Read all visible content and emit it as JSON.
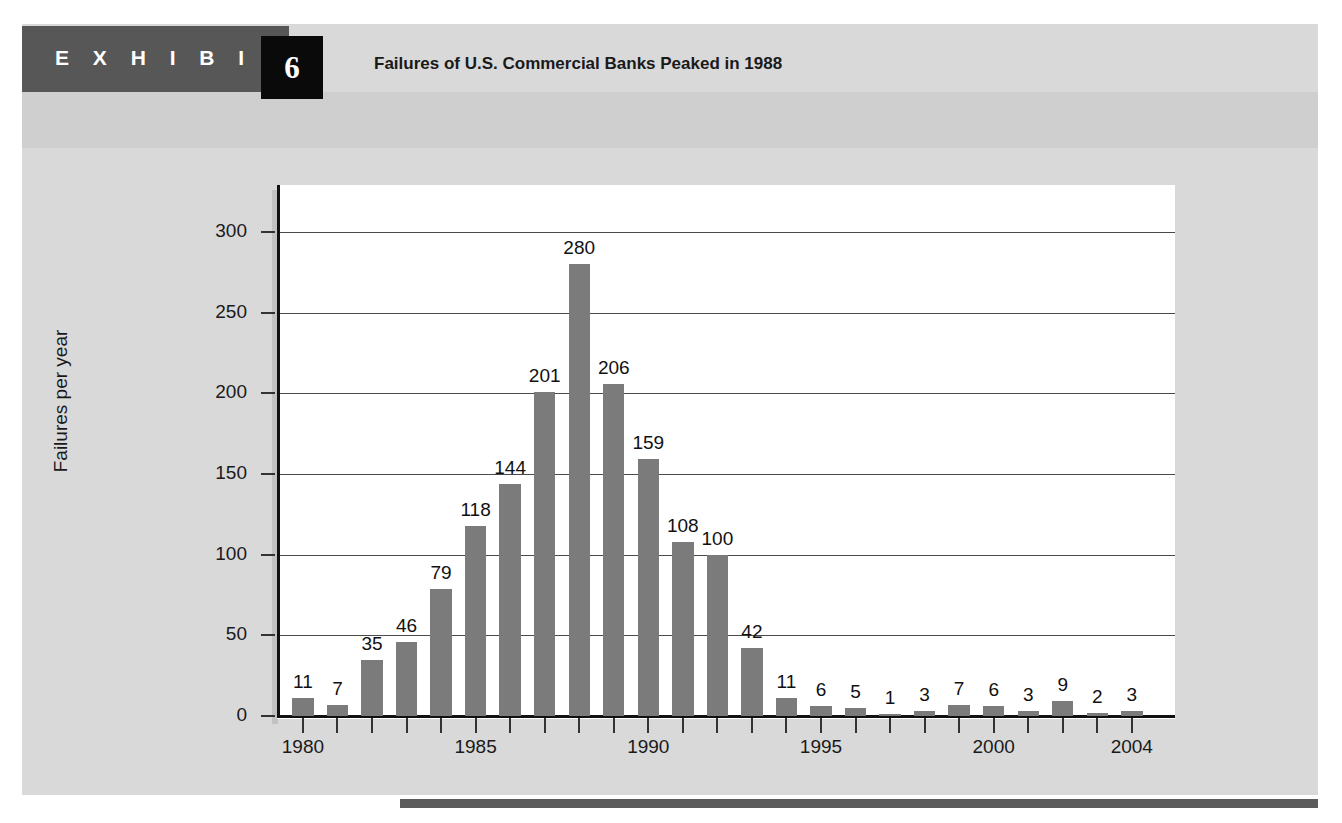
{
  "exhibit": {
    "label": "E X H I B I T",
    "number": "6",
    "title": "Failures of U.S. Commercial Banks Peaked in 1988"
  },
  "colors": {
    "band": "#575757",
    "number_box": "#0a0a0a",
    "sub_band": "#cfcfcf",
    "page_bg": "#d9d9d9",
    "bar": "#7b7b7b",
    "bottom_rule": "#5c5c5c",
    "gridline": "#4a4a4a"
  },
  "chart_data": {
    "type": "bar",
    "title": "Failures of U.S. Commercial Banks Peaked in 1988",
    "xlabel": "",
    "ylabel": "Failures per year",
    "ylim": [
      0,
      320
    ],
    "yticks": [
      0,
      50,
      100,
      150,
      200,
      250,
      300
    ],
    "ytick_labels": [
      "0",
      "50",
      "100",
      "150",
      "200",
      "250",
      "300"
    ],
    "grid": true,
    "legend": false,
    "categories": [
      1980,
      1981,
      1982,
      1983,
      1984,
      1985,
      1986,
      1987,
      1988,
      1989,
      1990,
      1991,
      1992,
      1993,
      1994,
      1995,
      1996,
      1997,
      1998,
      1999,
      2000,
      2001,
      2002,
      2003,
      2004
    ],
    "xtick_labels": [
      "1980",
      "1985",
      "1990",
      "1995",
      "2000",
      "2004"
    ],
    "xtick_years": [
      1980,
      1985,
      1990,
      1995,
      2000,
      2004
    ],
    "values": [
      11,
      7,
      35,
      46,
      79,
      118,
      144,
      201,
      280,
      206,
      159,
      108,
      100,
      42,
      11,
      6,
      5,
      1,
      3,
      7,
      6,
      3,
      9,
      2,
      3
    ],
    "data_labels": [
      "11",
      "7",
      "35",
      "46",
      "79",
      "118",
      "144",
      "201",
      "280",
      "206",
      "159",
      "108",
      "100",
      "42",
      "11",
      "6",
      "5",
      "1",
      "3",
      "7",
      "6",
      "3",
      "9",
      "2",
      "3"
    ]
  }
}
